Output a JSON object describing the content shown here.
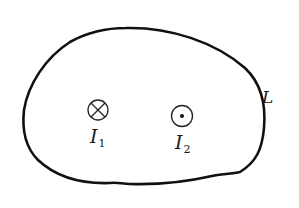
{
  "diagram": {
    "loop": {
      "label": "L",
      "stroke_color": "#111111"
    },
    "currents": [
      {
        "id": "I1",
        "symbol": "L_letter",
        "label_main": "I",
        "label_sub": "1",
        "direction": "into-page",
        "icon": "cross-circle-icon"
      },
      {
        "id": "I2",
        "symbol": "I",
        "label_main": "I",
        "label_sub": "2",
        "direction": "out-of-page",
        "icon": "dot-circle-icon"
      }
    ],
    "colors": {
      "background": "#ffffff",
      "ink": "#111111"
    }
  }
}
